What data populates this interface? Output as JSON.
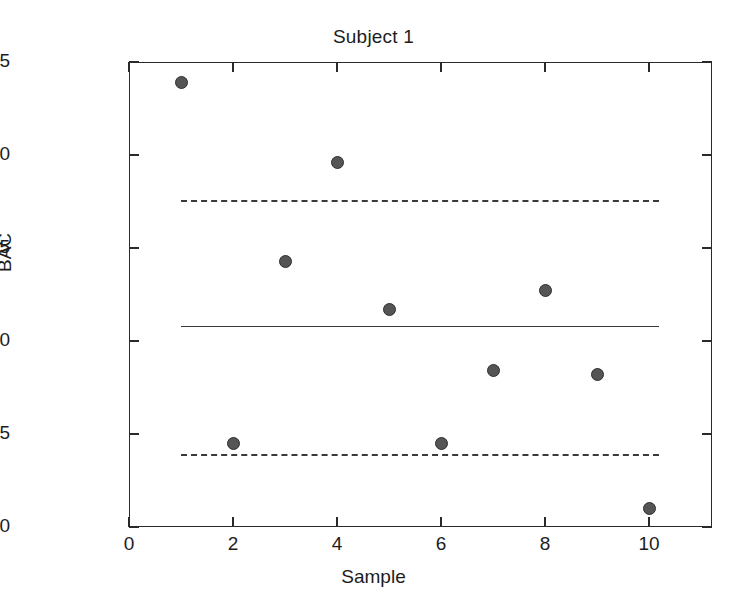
{
  "chart_data": {
    "type": "scatter",
    "title": "Subject 1",
    "xlabel": "Sample",
    "ylabel": "BAC",
    "x": [
      1,
      2,
      3,
      4,
      5,
      6,
      7,
      8,
      9,
      10
    ],
    "values": [
      0.1239,
      0.1045,
      0.1143,
      0.1196,
      0.1117,
      0.1045,
      0.1084,
      0.1127,
      0.1082,
      0.101
    ],
    "series": [
      {
        "name": "BAC measurement",
        "marker": "filled-circle",
        "color": "#555555",
        "values": [
          0.1239,
          0.1045,
          0.1143,
          0.1196,
          0.1117,
          0.1045,
          0.1084,
          0.1127,
          0.1082,
          0.101
        ]
      }
    ],
    "reference_lines": [
      {
        "name": "upper-control-limit",
        "value": 0.1176,
        "style": "dashed",
        "color": "#3a3a3a"
      },
      {
        "name": "center-line",
        "value": 0.1108,
        "style": "solid",
        "color": "#3a3a3a"
      },
      {
        "name": "lower-control-limit",
        "value": 0.1039,
        "style": "dashed",
        "color": "#3a3a3a"
      }
    ],
    "xlim": [
      0,
      11.21
    ],
    "ylim": [
      0.1,
      0.125
    ],
    "xticks": [
      0,
      2,
      4,
      6,
      8,
      10
    ],
    "xtick_labels": [
      "0",
      "2",
      "4",
      "6",
      "8",
      "10"
    ],
    "yticks": [
      0.1,
      0.105,
      0.11,
      0.115,
      0.12,
      0.125
    ],
    "ytick_labels": [
      "0.100",
      "0.105",
      "0.110",
      "0.115",
      "0.120",
      "0.125"
    ],
    "grid": false,
    "legend": "none",
    "frame": "box"
  },
  "axes": {
    "title": "Subject 1",
    "x_title": "Sample",
    "y_title": "BAC"
  }
}
